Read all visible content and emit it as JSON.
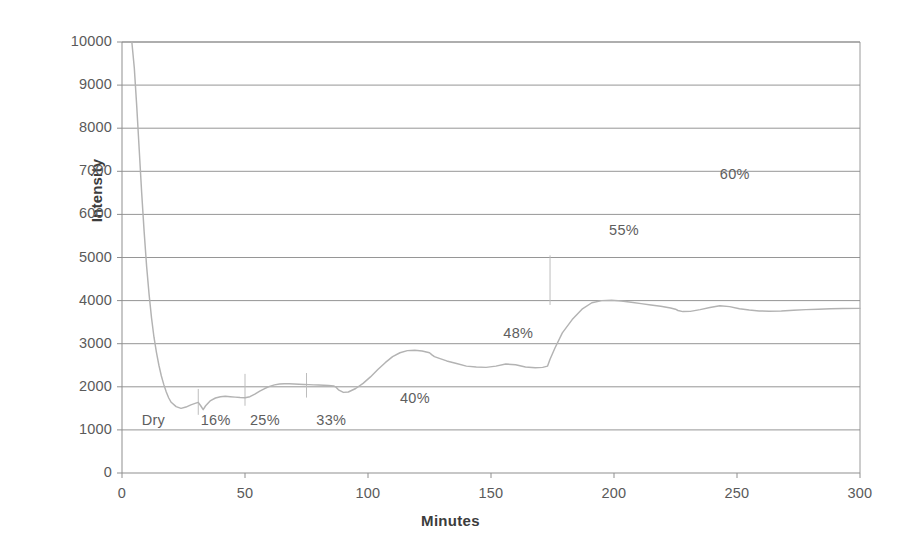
{
  "chart_data": {
    "type": "line",
    "title": "",
    "xlabel": "Minutes",
    "ylabel": "Intensity",
    "xlim": [
      0,
      300
    ],
    "ylim": [
      0,
      10000
    ],
    "xticks": [
      0,
      50,
      100,
      150,
      200,
      250,
      300
    ],
    "yticks": [
      0,
      1000,
      2000,
      3000,
      4000,
      5000,
      6000,
      7000,
      8000,
      9000,
      10000
    ],
    "xtick_labels": [
      "0",
      "50",
      "100",
      "150",
      "200",
      "250",
      "300"
    ],
    "ytick_labels": [
      "0",
      "1000",
      "2000",
      "3000",
      "4000",
      "5000",
      "6000",
      "7000",
      "8000",
      "9000",
      "10000"
    ],
    "grid": true,
    "grid_axis": "y",
    "legend": false,
    "line_color": "#b3b3b3",
    "background_color": "#ffffff",
    "series": [
      {
        "name": "Intensity",
        "x": [
          4,
          5,
          6,
          7,
          8,
          9,
          10,
          11,
          12,
          13,
          14,
          15,
          16,
          17,
          18,
          19,
          20,
          22,
          24,
          26,
          28,
          30,
          31,
          32,
          33,
          34,
          36,
          38,
          40,
          42,
          44,
          46,
          48,
          50,
          52,
          54,
          56,
          58,
          60,
          62,
          64,
          66,
          68,
          70,
          72,
          74,
          76,
          78,
          80,
          82,
          84,
          86,
          87,
          88,
          90,
          92,
          95,
          98,
          101,
          104,
          107,
          110,
          113,
          116,
          119,
          122,
          125,
          126,
          127,
          129,
          132,
          136,
          140,
          144,
          148,
          152,
          156,
          160,
          164,
          168,
          171,
          173,
          174,
          176,
          179,
          183,
          187,
          191,
          195,
          199,
          203,
          207,
          211,
          215,
          219,
          223,
          225,
          226,
          228,
          231,
          235,
          239,
          243,
          247,
          251,
          255,
          259,
          263,
          268,
          273,
          278,
          283,
          288,
          293,
          300
        ],
        "y": [
          10000,
          9400,
          8500,
          7500,
          6500,
          5600,
          4800,
          4150,
          3600,
          3150,
          2800,
          2500,
          2250,
          2050,
          1880,
          1740,
          1640,
          1540,
          1500,
          1530,
          1580,
          1620,
          1640,
          1560,
          1470,
          1560,
          1680,
          1740,
          1770,
          1780,
          1770,
          1760,
          1750,
          1745,
          1770,
          1830,
          1900,
          1960,
          2010,
          2045,
          2065,
          2070,
          2070,
          2065,
          2060,
          2055,
          2050,
          2045,
          2040,
          2035,
          2030,
          2020,
          1990,
          1930,
          1870,
          1880,
          1960,
          2080,
          2230,
          2400,
          2560,
          2700,
          2790,
          2840,
          2850,
          2830,
          2790,
          2740,
          2700,
          2660,
          2600,
          2540,
          2480,
          2460,
          2450,
          2480,
          2530,
          2510,
          2460,
          2440,
          2450,
          2480,
          2640,
          2900,
          3250,
          3560,
          3800,
          3950,
          4000,
          4010,
          3990,
          3960,
          3930,
          3900,
          3870,
          3830,
          3800,
          3770,
          3745,
          3750,
          3790,
          3840,
          3880,
          3860,
          3810,
          3780,
          3760,
          3755,
          3760,
          3775,
          3790,
          3800,
          3810,
          3815,
          3820
        ]
      }
    ],
    "annotations": [
      {
        "label": "Dry",
        "x": 8,
        "y": 1180
      },
      {
        "label": "16%",
        "x": 32,
        "y": 1180
      },
      {
        "label": "25%",
        "x": 52,
        "y": 1180
      },
      {
        "label": "33%",
        "x": 79,
        "y": 1180
      },
      {
        "label": "40%",
        "x": 113,
        "y": 1700
      },
      {
        "label": "48%",
        "x": 155,
        "y": 3200
      },
      {
        "label": "55%",
        "x": 198,
        "y": 5600
      },
      {
        "label": "60%",
        "x": 243,
        "y": 6900
      }
    ]
  },
  "axes": {
    "y_title": "Intensity",
    "x_title": "Minutes"
  }
}
